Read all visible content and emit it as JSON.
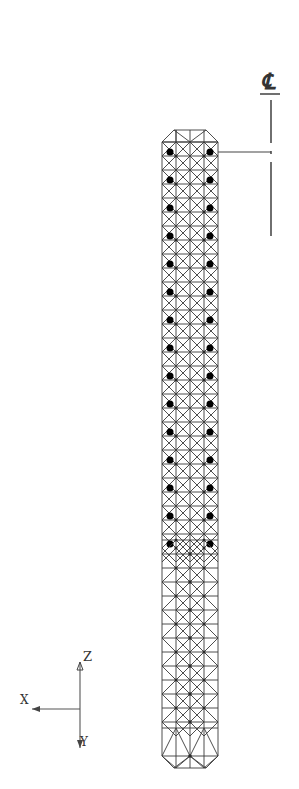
{
  "figure": {
    "type": "structural-wireframe",
    "centerline_symbol": "℄",
    "axes": {
      "z_label": "Z",
      "x_label": "X",
      "y_label": "Y"
    }
  },
  "geometry": {
    "column": {
      "left": 162,
      "right": 218,
      "top": 130,
      "bottom": 768,
      "chamfer": 12,
      "columns": 4,
      "dense_section": {
        "top": 130,
        "bottom": 540,
        "module": 14
      },
      "sparse_section": {
        "top": 540,
        "bottom": 768,
        "module": 28
      }
    },
    "centerline": {
      "x": 271,
      "segments": [
        [
          100,
          143
        ],
        [
          151,
          154
        ],
        [
          162,
          236
        ]
      ]
    },
    "leader": {
      "y": 152,
      "x1": 218,
      "x2": 271
    },
    "axis_triad": {
      "origin": [
        80,
        709
      ],
      "z_end": [
        80,
        662
      ],
      "x_end": [
        32,
        709
      ],
      "y_end": [
        80,
        748
      ]
    }
  },
  "colors": {
    "ink": "#3a3a3a",
    "background": "#ffffff"
  }
}
